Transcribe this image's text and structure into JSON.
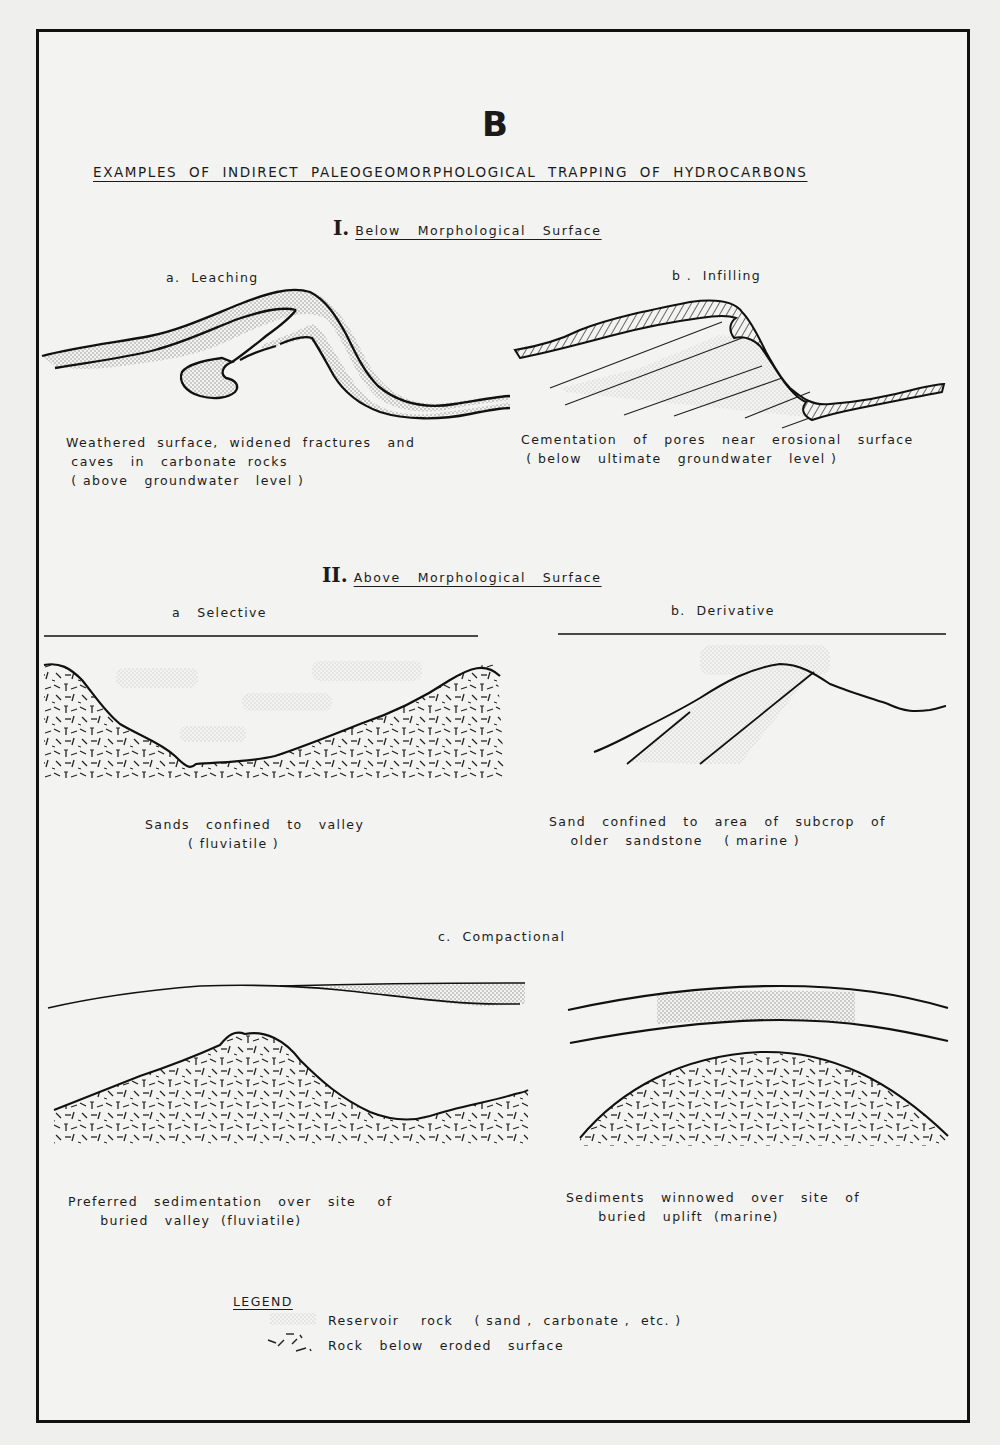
{
  "figure": {
    "letter": "B",
    "title": "EXAMPLES  OF  INDIRECT  PALEOGEOMORPHOLOGICAL  TRAPPING  OF  HYDROCARBONS"
  },
  "section_1": {
    "numeral": "I.",
    "label": "Below   Morphological   Surface",
    "panels": [
      {
        "id": "a",
        "heading": "a.  Leaching",
        "caption_lines": [
          "Weathered  surface,  widened  fractures   and",
          " caves   in   carbonate  rocks",
          " ( above   groundwater   level )"
        ]
      },
      {
        "id": "b",
        "heading": "b .  Infilling",
        "caption_lines": [
          "Cementation   of   pores   near   erosional   surface",
          " ( below   ultimate   groundwater   level )"
        ]
      }
    ]
  },
  "section_2": {
    "numeral": "II.",
    "label": "Above   Morphological   Surface",
    "panels": [
      {
        "id": "a",
        "heading": "a   Selective",
        "caption_lines": [
          "Sands   confined   to   valley",
          "        ( fluviatile )"
        ]
      },
      {
        "id": "b",
        "heading": "b.  Derivative",
        "caption_lines": [
          "Sand   confined   to   area   of   subcrop   of",
          "    older   sandstone    ( marine )"
        ]
      },
      {
        "id": "c",
        "heading": "c.  Compactional",
        "sub_panels": [
          {
            "caption_lines": [
              "Preferred   sedimentation   over   site    of",
              "      buried   valley  (fluviatile)"
            ]
          },
          {
            "caption_lines": [
              "Sediments   winnowed   over   site   of",
              "      buried   uplift  (marine)"
            ]
          }
        ]
      }
    ]
  },
  "legend": {
    "title": "LEGEND",
    "items": [
      {
        "symbol": "stipple-pattern",
        "label": "Reservoir    rock    ( sand ,  carbonate ,  etc. )"
      },
      {
        "symbol": "dash-pattern",
        "label": "Rock   below   eroded   surface"
      }
    ]
  },
  "colors": {
    "ink": "#1a1a1a",
    "paper": "#f3f3f1",
    "stipple": "#9a9a9a"
  }
}
